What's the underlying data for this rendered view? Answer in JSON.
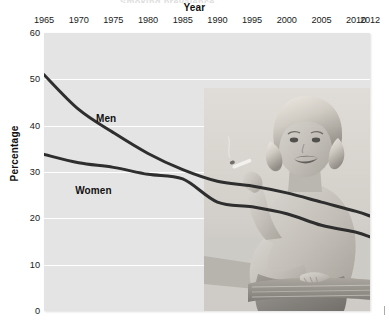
{
  "figure": {
    "cut_title": "Smoking prevalence",
    "x_axis_title": "Year",
    "y_axis_title": "Percentage"
  },
  "chart_data": {
    "type": "line",
    "title": "",
    "subtitle": "",
    "xlabel": "Year",
    "ylabel": "Percentage",
    "xlim": [
      1965,
      2012
    ],
    "ylim": [
      0,
      60
    ],
    "grid": true,
    "legend_position": "inline-labels",
    "x_tick_labels": [
      "1965",
      "1970",
      "1975",
      "1980",
      "1985",
      "1990",
      "1995",
      "2000",
      "2005",
      "2010",
      "2012"
    ],
    "x_ticks": [
      1965,
      1970,
      1975,
      1980,
      1985,
      1990,
      1995,
      2000,
      2005,
      2010,
      2012
    ],
    "y_tick_labels": [
      "0",
      "10",
      "20",
      "30",
      "40",
      "50",
      "60"
    ],
    "y_ticks": [
      0,
      10,
      20,
      30,
      40,
      50,
      60
    ],
    "x": [
      1965,
      1970,
      1975,
      1980,
      1985,
      1990,
      1995,
      2000,
      2005,
      2010,
      2012
    ],
    "series": [
      {
        "name": "Men",
        "color": "#2e2e2e",
        "values": [
          51.0,
          43.5,
          38.5,
          34.0,
          30.5,
          28.0,
          27.0,
          25.5,
          23.5,
          21.5,
          20.5
        ]
      },
      {
        "name": "Women",
        "color": "#2e2e2e",
        "values": [
          33.8,
          32.0,
          31.0,
          29.5,
          28.5,
          23.5,
          22.5,
          21.0,
          18.5,
          17.0,
          16.0
        ]
      }
    ],
    "annotations": [
      {
        "text": "Men",
        "x": 1972.5,
        "y": 41.5
      },
      {
        "text": "Women",
        "x": 1969.5,
        "y": 26.0
      }
    ]
  },
  "decoration": {
    "photo_alt": "vintage-woman-smoking-photo"
  },
  "colors": {
    "plot_background": "#e4e4e4",
    "gridline": "#ffffff",
    "line": "#2e2e2e",
    "text": "#1a1a1a",
    "page_background": "#ffffff"
  }
}
